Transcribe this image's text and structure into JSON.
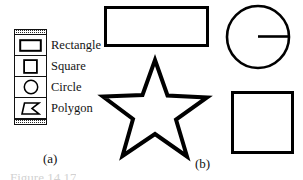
{
  "figure": {
    "caption_a": "(a)",
    "caption_b": "(b)",
    "bottom_caption": "Figure 14.17"
  },
  "palette": {
    "title": "Shape tools",
    "grip_top_name": "top-drag-grip",
    "grip_bottom_name": "bottom-drag-grip",
    "items": [
      {
        "label": "Rectangle",
        "icon": "rectangle-icon",
        "selected": false
      },
      {
        "label": "Square",
        "icon": "square-icon",
        "selected": false
      },
      {
        "label": "Circle",
        "icon": "circle-icon",
        "selected": false
      },
      {
        "label": "Polygon",
        "icon": "polygon-icon",
        "selected": false
      }
    ]
  },
  "canvas": {
    "stroke_color": "#000000",
    "fill_color": "#ffffff",
    "shapes": [
      {
        "name": "rectangle",
        "type": "rect",
        "x": 104,
        "y": 6,
        "width": 104,
        "height": 41,
        "stroke_width": 3
      },
      {
        "name": "star-polygon",
        "type": "polygon",
        "points": 5,
        "cx": 155,
        "cy": 112,
        "outer_r": 52,
        "inner_r": 23,
        "stroke_width": 4
      },
      {
        "name": "circle",
        "type": "circle",
        "cx": 258,
        "cy": 37,
        "r": 32,
        "stroke_width": 2.6
      },
      {
        "name": "circle-radius-line",
        "type": "line",
        "x1": 258,
        "y1": 37,
        "x2": 290,
        "y2": 37,
        "stroke_width": 2.6
      },
      {
        "name": "square",
        "type": "rect",
        "x": 231,
        "y": 91,
        "width": 63,
        "height": 63,
        "stroke_width": 3
      }
    ]
  }
}
